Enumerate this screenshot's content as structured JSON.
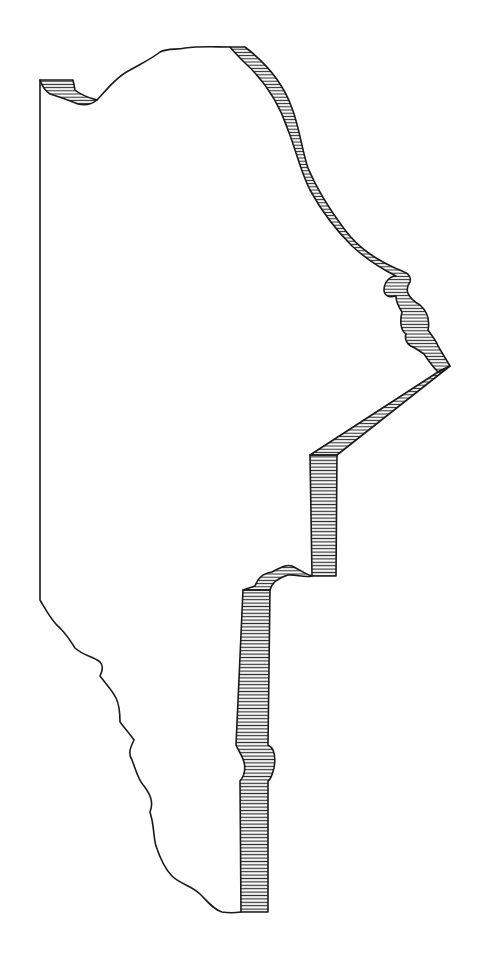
{
  "figure": {
    "colors": {
      "background": "#ffffff",
      "ink": "#1a1a1a",
      "hatch": "#2a2a2a"
    }
  }
}
